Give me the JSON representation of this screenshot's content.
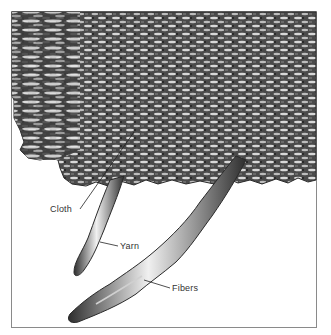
{
  "figure": {
    "labels": {
      "cloth": "Cloth",
      "yarn": "Yarn",
      "fibers": "Fibers"
    },
    "colors": {
      "background": "#ffffff",
      "frame": "#8a8a8a",
      "cloth_dark": "#3a3a3a",
      "cloth_mid": "#7a7a7a",
      "highlight": "#e6e6e6",
      "leader_line": "#222222",
      "label_text": "#333333"
    }
  }
}
